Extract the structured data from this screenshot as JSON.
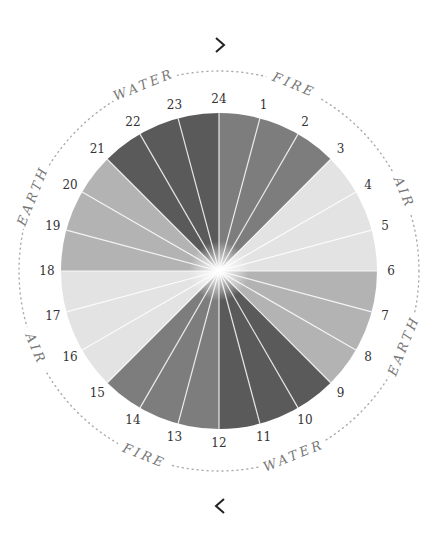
{
  "navigation": {
    "next_icon": "chevron-right-icon",
    "prev_icon": "chevron-left-icon"
  },
  "wheel": {
    "center": [
      219,
      271
    ],
    "radius": 158,
    "ring_radius": 200,
    "hours": [
      "24",
      "1",
      "2",
      "3",
      "4",
      "5",
      "6",
      "7",
      "8",
      "9",
      "10",
      "11",
      "12",
      "13",
      "14",
      "15",
      "16",
      "17",
      "18",
      "19",
      "20",
      "21",
      "22",
      "23"
    ],
    "sectors": [
      {
        "element": "fire",
        "from": 24,
        "to": 3,
        "color": "#7d7d7d"
      },
      {
        "element": "air",
        "from": 3,
        "to": 6,
        "color": "#e3e3e3"
      },
      {
        "element": "earth",
        "from": 6,
        "to": 9,
        "color": "#b3b3b3"
      },
      {
        "element": "water",
        "from": 9,
        "to": 12,
        "color": "#5a5a5a"
      },
      {
        "element": "fire",
        "from": 12,
        "to": 15,
        "color": "#7d7d7d"
      },
      {
        "element": "air",
        "from": 15,
        "to": 18,
        "color": "#e3e3e3"
      },
      {
        "element": "earth",
        "from": 18,
        "to": 21,
        "color": "#b3b3b3"
      },
      {
        "element": "water",
        "from": 21,
        "to": 24,
        "color": "#5a5a5a"
      }
    ],
    "ring_labels": [
      {
        "text": "WATER",
        "angle": -22
      },
      {
        "text": "FIRE",
        "angle": 22
      },
      {
        "text": "AIR",
        "angle": 67
      },
      {
        "text": "EARTH",
        "angle": 112
      },
      {
        "text": "WATER",
        "angle": 158
      },
      {
        "text": "FIRE",
        "angle": 202
      },
      {
        "text": "AIR",
        "angle": 247
      },
      {
        "text": "EARTH",
        "angle": 292
      }
    ]
  }
}
